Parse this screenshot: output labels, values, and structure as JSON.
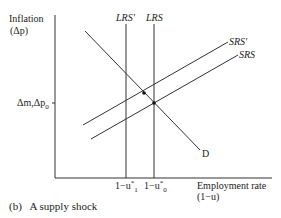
{
  "figure": {
    "caption": "(b)   A supply shock",
    "y_axis": {
      "title": "Inflation",
      "subtitle": "(Δp)"
    },
    "x_axis": {
      "title": "Employment rate",
      "subtitle": "(1−u)"
    },
    "y_tick": "Δm,Δp",
    "y_tick_sub": "0",
    "x_ticks": [
      {
        "base": "1−u",
        "sup": "*",
        "sub": "1"
      },
      {
        "base": "1−u",
        "sup": "*",
        "sub": "0"
      }
    ],
    "curves": {
      "lrs_prime": "LRS'",
      "lrs": "LRS",
      "srs_prime": "SRS'",
      "srs": "SRS",
      "demand": "D"
    },
    "line_color": "#333333"
  }
}
